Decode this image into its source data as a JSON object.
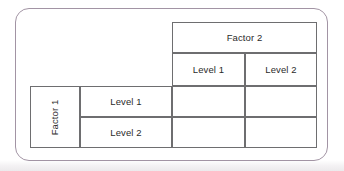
{
  "diagram": {
    "frame": {
      "border_color": "#a294a4",
      "shape": "rounded-rectangle"
    },
    "grid_line_color": "#6e6e70",
    "text_color": "#2b2b2b",
    "column_header": {
      "factor_label": "Factor 2",
      "levels": [
        "Level 1",
        "Level 2"
      ]
    },
    "row_header": {
      "factor_label": "Factor 1",
      "factor_label_orientation": "vertical-bottom-to-top",
      "levels": [
        "Level 1",
        "Level 2"
      ]
    },
    "body_cells": [
      [
        "",
        ""
      ],
      [
        "",
        ""
      ]
    ]
  }
}
